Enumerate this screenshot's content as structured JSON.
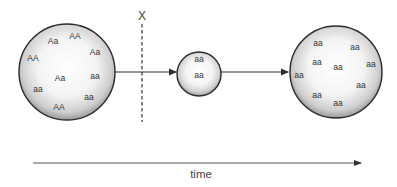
{
  "diagram": {
    "marker_label": "X",
    "time_label": "time",
    "colors": {
      "stroke": "#2b2b2b",
      "fill_center": "#ffffff",
      "fill_edge": "#9a9a9a",
      "text": "#333333",
      "time_axis": "#555555"
    },
    "populations": [
      {
        "name": "original-population",
        "cx": 67,
        "cy": 72,
        "r": 48,
        "alleles": [
          {
            "label": "Aa",
            "x": 53,
            "y": 42
          },
          {
            "label": "AA",
            "x": 75,
            "y": 37
          },
          {
            "label": "AA",
            "x": 33,
            "y": 59
          },
          {
            "label": "Aa",
            "x": 95,
            "y": 53
          },
          {
            "label": "Aa",
            "x": 60,
            "y": 79
          },
          {
            "label": "aa",
            "x": 95,
            "y": 77
          },
          {
            "label": "aa",
            "x": 38,
            "y": 90
          },
          {
            "label": "aa",
            "x": 89,
            "y": 98
          },
          {
            "label": "AA",
            "x": 59,
            "y": 108
          }
        ]
      },
      {
        "name": "bottleneck-population",
        "cx": 199,
        "cy": 74,
        "r": 22,
        "alleles": [
          {
            "label": "aa",
            "x": 199,
            "y": 60
          },
          {
            "label": "aa",
            "x": 199,
            "y": 76
          }
        ]
      },
      {
        "name": "resulting-population",
        "cx": 336,
        "cy": 72,
        "r": 46,
        "alleles": [
          {
            "label": "aa",
            "x": 318,
            "y": 44
          },
          {
            "label": "aa",
            "x": 355,
            "y": 48
          },
          {
            "label": "aa",
            "x": 317,
            "y": 63
          },
          {
            "label": "aa",
            "x": 338,
            "y": 68
          },
          {
            "label": "aa",
            "x": 371,
            "y": 65
          },
          {
            "label": "aa",
            "x": 299,
            "y": 76
          },
          {
            "label": "aa",
            "x": 361,
            "y": 86
          },
          {
            "label": "aa",
            "x": 317,
            "y": 96
          },
          {
            "label": "aa",
            "x": 338,
            "y": 104
          }
        ]
      }
    ]
  }
}
